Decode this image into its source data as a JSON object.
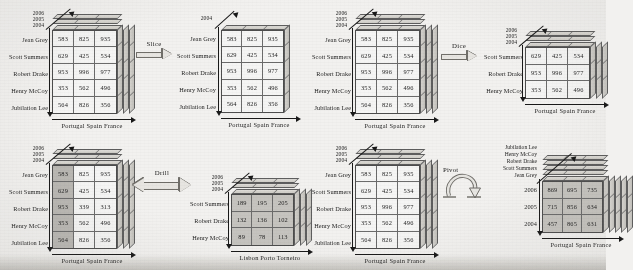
{
  "figure": {
    "background_color": "#f2f1ef",
    "ink_color": "#1a1a1a"
  },
  "dimensions": {
    "measure_rows": [
      "Jean Grey",
      "Scott Summers",
      "Robert Drake",
      "Henry McCoy",
      "Jubilation Lee"
    ],
    "countries": "Portugal Spain France",
    "cities": "Lisbon  Porto  Torneiro",
    "years": [
      "2006",
      "2005",
      "2004"
    ]
  },
  "panels": {
    "slice": {
      "operation_label": "Slice",
      "arrow_type": "single-right",
      "source": {
        "row_labels": [
          "Jean Grey",
          "Scott Summers",
          "Robert Drake",
          "Henry McCoy",
          "Jubilation Lee"
        ],
        "z_labels": [
          "2006",
          "2005",
          "2004"
        ],
        "x_label": "Portugal Spain France",
        "values": [
          [
            "583",
            "825",
            "935"
          ],
          [
            "629",
            "425",
            "534"
          ],
          [
            "953",
            "996",
            "977"
          ],
          [
            "353",
            "562",
            "496"
          ],
          [
            "564",
            "826",
            "356"
          ]
        ]
      },
      "result": {
        "row_labels": [
          "Jean Grey",
          "Scott Summers",
          "Robert Drake",
          "Henry McCoy",
          "Jubilation Lee"
        ],
        "z_labels": [
          "2004"
        ],
        "x_label": "Portugal Spain France",
        "values": [
          [
            "583",
            "825",
            "935"
          ],
          [
            "629",
            "425",
            "534"
          ],
          [
            "953",
            "996",
            "977"
          ],
          [
            "353",
            "562",
            "496"
          ],
          [
            "564",
            "826",
            "356"
          ]
        ]
      }
    },
    "dice": {
      "operation_label": "Dice",
      "arrow_type": "single-right",
      "source": {
        "row_labels": [
          "Jean Grey",
          "Scott Summers",
          "Robert Drake",
          "Henry McCoy",
          "Jubilation Lee"
        ],
        "z_labels": [
          "2006",
          "2005",
          "2004"
        ],
        "x_label": "Portugal Spain France",
        "values": [
          [
            "583",
            "825",
            "935"
          ],
          [
            "629",
            "425",
            "534"
          ],
          [
            "953",
            "996",
            "977"
          ],
          [
            "353",
            "562",
            "496"
          ],
          [
            "564",
            "826",
            "356"
          ]
        ]
      },
      "result": {
        "row_labels": [
          "Scott Summers",
          "Robert Drake",
          "Henry McCoy"
        ],
        "z_labels": [
          "2006",
          "2005",
          "2004"
        ],
        "x_label": "Portugal Spain France",
        "values": [
          [
            "629",
            "425",
            "534"
          ],
          [
            "953",
            "996",
            "977"
          ],
          [
            "353",
            "562",
            "496"
          ]
        ]
      }
    },
    "drill": {
      "operation_label": "Drill",
      "arrow_type": "bidirectional",
      "source": {
        "row_labels": [
          "Jean Grey",
          "Scott Summers",
          "Robert Drake",
          "Henry McCoy",
          "Jubilation Lee"
        ],
        "z_labels": [
          "2006",
          "2005",
          "2004"
        ],
        "x_label": "Portugal Spain France",
        "values": [
          [
            "583",
            "825",
            "935"
          ],
          [
            "629",
            "425",
            "534"
          ],
          [
            "953",
            "339",
            "313"
          ],
          [
            "353",
            "562",
            "496"
          ],
          [
            "564",
            "826",
            "356"
          ]
        ],
        "highlighted_column": 0
      },
      "result": {
        "row_labels": [
          "Scott Summers",
          "Robert Drake",
          "Henry McCoy"
        ],
        "z_labels": [
          "2006",
          "2005",
          "2004"
        ],
        "x_label": "Lisbon  Porto  Torneiro",
        "values": [
          [
            "189",
            "195",
            "205"
          ],
          [
            "132",
            "136",
            "102"
          ],
          [
            "89",
            "78",
            "113"
          ]
        ]
      }
    },
    "pivot": {
      "operation_label": "Pivot",
      "arrow_type": "rotation",
      "source": {
        "row_labels": [
          "Jean Grey",
          "Scott Summers",
          "Robert Drake",
          "Henry McCoy",
          "Jubilation Lee"
        ],
        "z_labels": [
          "2006",
          "2005",
          "2004"
        ],
        "x_label": "Portugal Spain France",
        "values": [
          [
            "583",
            "825",
            "935"
          ],
          [
            "629",
            "425",
            "534"
          ],
          [
            "953",
            "996",
            "977"
          ],
          [
            "353",
            "562",
            "496"
          ],
          [
            "564",
            "826",
            "356"
          ]
        ]
      },
      "result": {
        "row_labels": [
          "2006",
          "2005",
          "2004"
        ],
        "z_labels": [
          "Jubilation Lee",
          "Henry McCoy",
          "Robert Drake",
          "Scott Summers",
          "Jean Grey"
        ],
        "x_label": "Portugal Spain France",
        "values": [
          [
            "869",
            "695",
            "735"
          ],
          [
            "715",
            "856",
            "634"
          ],
          [
            "457",
            "865",
            "631"
          ]
        ]
      }
    }
  }
}
